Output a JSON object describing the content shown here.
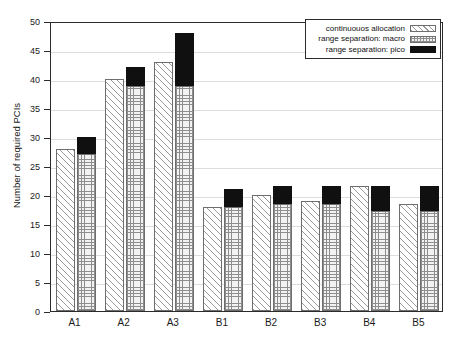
{
  "chart_data": {
    "type": "bar",
    "title": "",
    "xlabel": "",
    "ylabel": "Number of required PCIs",
    "categories": [
      "A1",
      "A2",
      "A3",
      "B1",
      "B2",
      "B3",
      "B4",
      "B5"
    ],
    "ylim": [
      0,
      50
    ],
    "yticks": [
      0,
      5,
      10,
      15,
      20,
      25,
      30,
      35,
      40,
      45,
      50
    ],
    "grid": true,
    "legend_position": "top-right",
    "stacked_second_bar": true,
    "series": [
      {
        "name": "continuouos allocation",
        "pattern": "diagonal-hatch",
        "color": "#ffffff",
        "values": [
          28,
          40,
          43,
          18,
          20,
          19,
          21.5,
          18.5
        ]
      },
      {
        "name": "range separation: macro",
        "pattern": "cross-hatch",
        "color": "#f2f2f2",
        "values": [
          27,
          38.8,
          38.8,
          18,
          18.5,
          18.5,
          17.3,
          17.3
        ]
      },
      {
        "name": "range separation: pico",
        "pattern": "solid",
        "color": "#101010",
        "values": [
          3,
          3.2,
          9.2,
          3,
          3,
          3,
          4.2,
          4.2
        ],
        "stacked_totals": [
          30,
          42,
          48,
          21,
          21.5,
          21.5,
          21.5,
          21.5
        ]
      }
    ]
  },
  "legend": {
    "items": [
      {
        "label": "continuouos allocation",
        "swatch": "hatch-swatch"
      },
      {
        "label": "range separation: macro",
        "swatch": "crosshatch-swatch"
      },
      {
        "label": "range separation: pico",
        "swatch": "solid-swatch"
      }
    ]
  },
  "axis": {
    "y_label": "Number of required PCIs",
    "y_ticks": [
      "0",
      "5",
      "10",
      "15",
      "20",
      "25",
      "30",
      "35",
      "40",
      "45",
      "50"
    ],
    "x_ticks": [
      "A1",
      "A2",
      "A3",
      "B1",
      "B2",
      "B3",
      "B4",
      "B5"
    ]
  }
}
